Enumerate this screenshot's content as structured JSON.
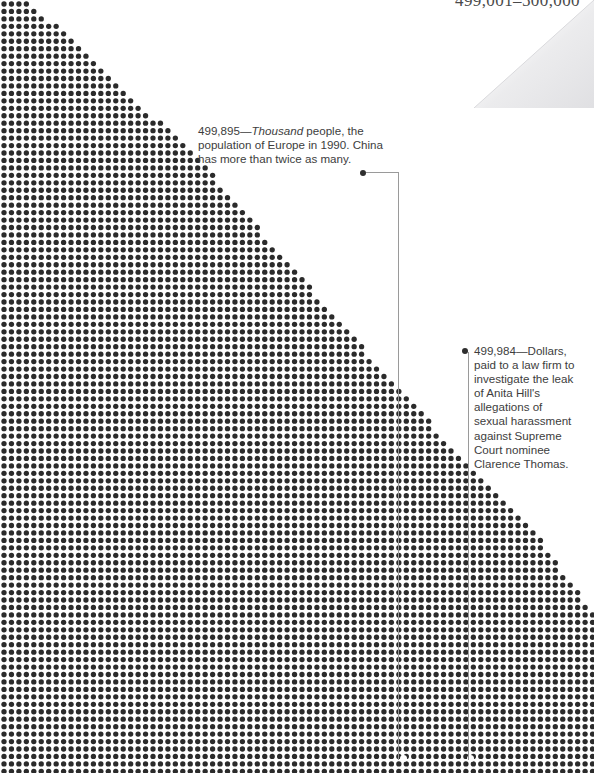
{
  "page": {
    "width": 594,
    "height": 773,
    "background_color": "#ffffff",
    "dot_color": "#2b2b2b",
    "leader_color": "#9a9a9a",
    "text_color": "#3d3d3d"
  },
  "running_head": {
    "label": "499,001–500,000"
  },
  "chart_data": {
    "type": "scatter",
    "title": "499,001–500,000",
    "xlabel": "",
    "ylabel": "",
    "dot_grid": {
      "spacing_px": 7.45,
      "dot_diameter_px": 5.3,
      "origin_x_px": 4,
      "origin_y_px": 4,
      "columns": 80,
      "rows": 104,
      "fill_rule": "diagonal",
      "boundary_points": [
        [
          28,
          0
        ],
        [
          195,
          155
        ],
        [
          395,
          385
        ],
        [
          545,
          545
        ],
        [
          594,
          615
        ]
      ]
    },
    "highlighted_points": [
      {
        "id": "europe-population",
        "x_px": 403,
        "y_px": 758
      },
      {
        "id": "anita-hill-dollars",
        "x_px": 470,
        "y_px": 758
      }
    ]
  },
  "annotations": [
    {
      "id": "europe-population",
      "value": "499,895",
      "dash": "—",
      "emphasis": "Thousand",
      "text_after": " people, the population of Europe in 1990. China has more than twice as many.",
      "bullet": {
        "x": 360,
        "y": 170
      },
      "leader": {
        "h_from": 366,
        "h_to": 398,
        "h_y": 172,
        "v_x": 398,
        "v_from": 172,
        "v_to": 760
      }
    },
    {
      "id": "anita-hill-dollars",
      "value": "499,984",
      "dash": "—",
      "text_after": "Dollars, paid to a law firm to investigate the leak of Anita Hill's allegations of sexual harassment against Supreme Court nominee Clarence Thomas.",
      "bullet": {
        "x": 462,
        "y": 348
      },
      "leader": {
        "v_x": 468,
        "v_from": 352,
        "v_to": 760
      }
    }
  ]
}
